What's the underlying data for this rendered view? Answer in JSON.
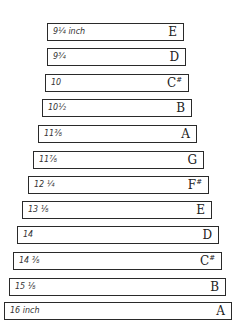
{
  "title": "",
  "bars": [
    {
      "length": "9¼ inch",
      "note": "E",
      "sharp": "",
      "left": 47,
      "right": 184,
      "top": 23
    },
    {
      "length": "9¾",
      "note": "D",
      "sharp": "",
      "left": 47,
      "right": 186,
      "top": 48
    },
    {
      "length": "10",
      "note": "C",
      "sharp": "#",
      "left": 45,
      "right": 189,
      "top": 74
    },
    {
      "length": "10½",
      "note": "B",
      "sharp": "",
      "left": 42,
      "right": 192,
      "top": 99
    },
    {
      "length": "11⅜",
      "note": "A",
      "sharp": "",
      "left": 38,
      "right": 197,
      "top": 125
    },
    {
      "length": "11⅞",
      "note": "G",
      "sharp": "",
      "left": 33,
      "right": 204,
      "top": 151
    },
    {
      "length": "12 ¼",
      "note": "F",
      "sharp": "#",
      "left": 28,
      "right": 209,
      "top": 176
    },
    {
      "length": "13 ⅛",
      "note": "E",
      "sharp": "",
      "left": 22,
      "right": 212,
      "top": 201
    },
    {
      "length": "14",
      "note": "D",
      "sharp": "",
      "left": 17,
      "right": 219,
      "top": 226
    },
    {
      "length": "14 ⅜",
      "note": "C",
      "sharp": "#",
      "left": 13,
      "right": 222,
      "top": 252
    },
    {
      "length": "15 ⅛",
      "note": "B",
      "sharp": "",
      "left": 9,
      "right": 226,
      "top": 278
    },
    {
      "length": "16 inch",
      "note": "A",
      "sharp": "",
      "left": 4,
      "right": 232,
      "top": 302
    }
  ]
}
